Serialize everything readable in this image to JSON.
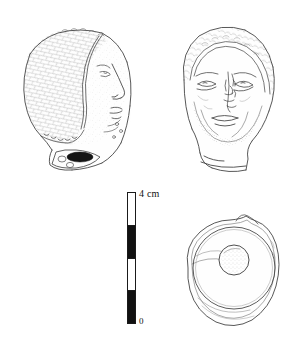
{
  "plate": {
    "kind": "archaeological-object-illustration-plate",
    "background_color": "#ffffff",
    "ink_color": "#444444",
    "outline_color": "#333333"
  },
  "scale": {
    "top_label": "4 cm",
    "bottom_label": "0",
    "unit": "cm",
    "max_value": "4",
    "min_value": "0",
    "segment_count": "4",
    "segment_value": "1",
    "segments": [
      {
        "fill": "white"
      },
      {
        "fill": "black"
      },
      {
        "fill": "white"
      },
      {
        "fill": "black"
      }
    ],
    "bar_fill_black": "#111111",
    "bar_fill_white": "#ffffff",
    "bar_stroke": "#1a1a1a"
  },
  "figures": [
    {
      "id": "profile-head",
      "label": "Head, left profile view",
      "view": "profile",
      "features": "textured cap-like hair, nose, lips, chin, broken neck"
    },
    {
      "id": "frontal-head",
      "label": "Head, frontal view",
      "view": "frontal",
      "features": "brows, eyes, damaged nose, mouth, stippled beard, broken neck"
    },
    {
      "id": "circular-section",
      "label": "Object, plan view with central perforation",
      "view": "plan",
      "features": "outer irregular rim, inner ring, central circular hole"
    }
  ]
}
